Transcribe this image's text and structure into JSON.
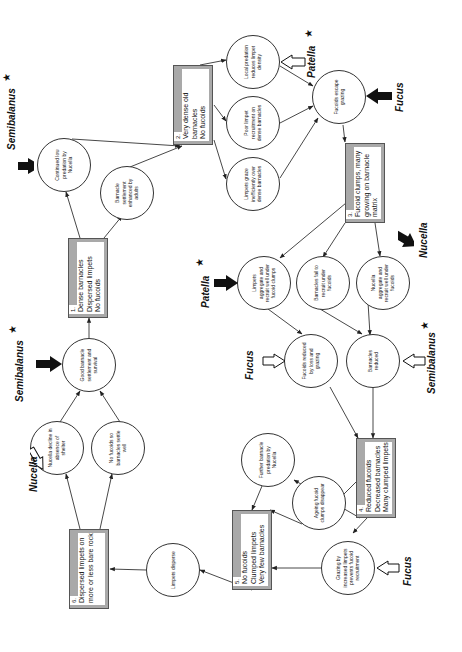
{
  "diagram": {
    "orientation": "rotated 90 degrees counter-clockwise",
    "boxes": [
      {
        "id": "1",
        "number": "1.",
        "lines": [
          "Dense barnacles",
          "Dispersed limpets",
          "No fucoids"
        ]
      },
      {
        "id": "2",
        "number": "2.",
        "lines": [
          "Very dense old",
          "barnacles",
          "No fucoids"
        ]
      },
      {
        "id": "3",
        "number": "3.",
        "lines": [
          "Fucoid clumps, many",
          "growing on barnacle",
          "matrix"
        ]
      },
      {
        "id": "4",
        "number": "4.",
        "lines": [
          "Reduced fucoids",
          "Decreased barnacles",
          "Many clumped limpets"
        ]
      },
      {
        "id": "5",
        "number": "5.",
        "lines": [
          "No fucoids",
          "Clumped limpets",
          "Very few barnacles"
        ]
      },
      {
        "id": "6",
        "number": "6.",
        "lines": [
          "Dispersed limpets on",
          "more or less bare rock"
        ]
      }
    ],
    "circles": [
      {
        "id": "c_low_predation",
        "text": "Continued low predation by Nucella"
      },
      {
        "id": "c_settlement_adults",
        "text": "Barnacle settlement enhanced by adults"
      },
      {
        "id": "c_good_settlement",
        "text": "Good barnacle settlement and survival"
      },
      {
        "id": "c_nucella_decline",
        "text": "Nucella decline in absence of shelter"
      },
      {
        "id": "c_no_fucoids",
        "text": "No fucoids so barnacles settle well"
      },
      {
        "id": "c_limpets_disperse",
        "text": "Limpets disperse"
      },
      {
        "id": "c_local_predation",
        "text": "Local predation reduces limpet density"
      },
      {
        "id": "c_poor_recruitment",
        "text": "Poor limpet recruitment on dense barnacles"
      },
      {
        "id": "c_graze_inefficiently",
        "text": "Limpets graze inefficiently over dense barnacles"
      },
      {
        "id": "c_fucoids_escape",
        "text": "Fucoids escape grazing"
      },
      {
        "id": "c_limpets_aggregate",
        "text": "Limpets aggregate and recruit well under fucoid clumps"
      },
      {
        "id": "c_barnacles_fail",
        "text": "Barnacles fail to recruit under fucoids"
      },
      {
        "id": "c_nucella_aggregate",
        "text": "Nucella aggregate and recruit well under fucoids"
      },
      {
        "id": "c_fucoids_reduced",
        "text": "Fucoids reduced by loss and grazing"
      },
      {
        "id": "c_barnacles_reduced",
        "text": "Barnacles reduced"
      },
      {
        "id": "c_further_predation",
        "text": "Further barnacle predation by Nucella"
      },
      {
        "id": "c_ageing_clumps",
        "text": "Ageing fucoid clumps disappear"
      },
      {
        "id": "c_grazing_prevents",
        "text": "Grazing by increased limpets prevents fucoid recruitment"
      }
    ],
    "species_labels": [
      {
        "id": "s1",
        "name": "Semibalanus",
        "arrow": "filled",
        "star": true,
        "target": "c_low_predation"
      },
      {
        "id": "s2",
        "name": "Semibalanus",
        "arrow": "filled",
        "star": true,
        "target": "c_good_settlement"
      },
      {
        "id": "s3",
        "name": "Nucella",
        "arrow": "hollow",
        "star": false,
        "target": "c_nucella_decline"
      },
      {
        "id": "s4",
        "name": "Patella",
        "arrow": "hollow",
        "star": true,
        "target": "c_local_predation"
      },
      {
        "id": "s5",
        "name": "Fucus",
        "arrow": "filled",
        "star": false,
        "target": "c_fucoids_escape"
      },
      {
        "id": "s6",
        "name": "Patella",
        "arrow": "filled",
        "star": true,
        "target": "c_limpets_aggregate"
      },
      {
        "id": "s7",
        "name": "Nucella",
        "arrow": "filled",
        "star": false,
        "target": "c_nucella_aggregate"
      },
      {
        "id": "s8",
        "name": "Fucus",
        "arrow": "hollow",
        "star": false,
        "target": "c_fucoids_reduced"
      },
      {
        "id": "s9",
        "name": "Semibalanus",
        "arrow": "hollow",
        "star": true,
        "target": "c_barnacles_reduced"
      },
      {
        "id": "s10",
        "name": "Fucus",
        "arrow": "hollow",
        "star": false,
        "target": "c_grazing_prevents"
      }
    ],
    "star_glyph": "★"
  }
}
